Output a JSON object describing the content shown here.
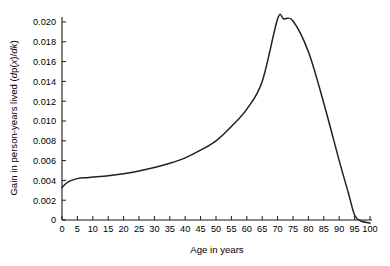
{
  "chart_data": {
    "type": "line",
    "title": "",
    "xlabel": "Age in years",
    "ylabel": "Gain in person-years lived (dp(x)/dk)",
    "ylabel_parts": {
      "prefix": "Gain in person-years lived (",
      "italic_d": "d",
      "mid1": "p(",
      "italic_x": "x",
      "mid2": ")/",
      "italic_dk": "dk",
      "suffix": ")"
    },
    "xlim": [
      0,
      100
    ],
    "ylim": [
      -0.0009,
      0.0215
    ],
    "xticks": [
      0,
      5,
      10,
      15,
      20,
      25,
      30,
      35,
      40,
      45,
      50,
      55,
      60,
      65,
      70,
      75,
      80,
      85,
      90,
      95,
      100
    ],
    "xticklabels": [
      "0",
      "5",
      "10",
      "15",
      "20",
      "25",
      "30",
      "35",
      "40",
      "45",
      "50",
      "55",
      "60",
      "65",
      "70",
      "75",
      "80",
      "85",
      "90",
      "95",
      "100"
    ],
    "yticks": [
      0,
      0.002,
      0.004,
      0.006,
      0.008,
      0.01,
      0.012,
      0.014,
      0.016,
      0.018,
      0.02
    ],
    "yticklabels": [
      "0",
      "0.002",
      "0.004",
      "0.006",
      "0.008",
      "0.010",
      "0.012",
      "0.014",
      "0.016",
      "0.018",
      "0.020"
    ],
    "grid": false,
    "legend": null,
    "series": [
      {
        "name": "Gain in person-years lived",
        "color": "#231f20",
        "x": [
          0,
          2,
          5,
          8,
          10,
          15,
          20,
          25,
          30,
          35,
          40,
          45,
          50,
          55,
          60,
          65,
          70,
          72,
          75,
          80,
          85,
          90,
          93,
          95,
          97,
          100
        ],
        "y": [
          0.0033,
          0.00385,
          0.00418,
          0.00428,
          0.00434,
          0.00448,
          0.00468,
          0.00495,
          0.0053,
          0.00573,
          0.00628,
          0.00705,
          0.008,
          0.00945,
          0.0112,
          0.014,
          0.0203,
          0.0203,
          0.0201,
          0.017,
          0.0118,
          0.006,
          0.0027,
          0.0005,
          -0.0001,
          -0.0003
        ]
      }
    ],
    "peak": {
      "age": 71,
      "value": 0.0203
    },
    "start": {
      "age": 0,
      "value": 0.0033
    },
    "end": {
      "age": 100,
      "value": -0.0003
    }
  }
}
